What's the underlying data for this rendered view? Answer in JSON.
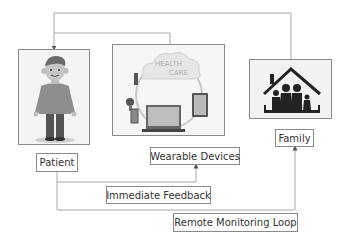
{
  "diagram": {
    "nodes": [
      {
        "id": "patient",
        "label": "Patient",
        "icon": "person-illustration"
      },
      {
        "id": "wearable",
        "label": "Wearable Devices",
        "icon": "healthcare-cloud-devices",
        "image_text": [
          "HEALTH",
          "CARE"
        ]
      },
      {
        "id": "family",
        "label": "Family",
        "icon": "family-house"
      }
    ],
    "edge_labels": {
      "immediate": "Immediate Feedback",
      "remote": "Remote Monitoring Loop"
    },
    "edges": [
      {
        "from": "wearable",
        "to": "patient"
      },
      {
        "from": "family",
        "to": "patient"
      },
      {
        "from": "patient",
        "to": "wearable",
        "label": "Immediate Feedback"
      },
      {
        "from": "patient",
        "to": "family",
        "label": "Remote Monitoring Loop"
      }
    ],
    "colors": {
      "line": "#a0a0a0",
      "border": "#8a8a8a",
      "text": "#333333"
    }
  }
}
